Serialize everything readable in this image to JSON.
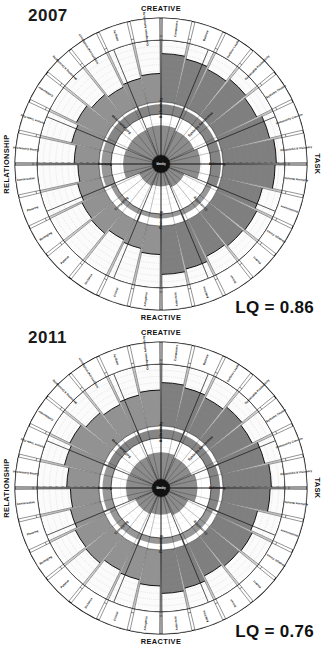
{
  "meta": {
    "colors": {
      "fill_dark": "#787878",
      "fill_mid": "#8c8c8c",
      "stroke": "#111111",
      "grid": "#9a9a9a",
      "background": "#ffffff",
      "hub": "#111111"
    }
  },
  "panels": [
    {
      "year": "2007",
      "lq": "LQ = 0.86",
      "axes": {
        "top": "CREATIVE",
        "bottom": "REACTIVE",
        "left": "RELATIONSHIP",
        "right": "TASK"
      },
      "hub_label": "Identity",
      "summary_ring": [
        "Authenticity",
        "Systems Awareness",
        "Achieving",
        "Controlling",
        "Protecting",
        "Complying",
        "Relating",
        "Self-Awareness"
      ],
      "outer_dimensions": [
        "Composure",
        "Balance",
        "Selfless Leader",
        "Sustainable Productivity",
        "Systems Thinker",
        "Community Concern",
        "Purposeful & Visionary",
        "Achieves Results",
        "Decisiveness",
        "Strategic Focus",
        "Perfect",
        "Driven",
        "Ambition",
        "Autocratic",
        "Arrogance",
        "Critical",
        "Distance",
        "Passive",
        "Belonging",
        "Pleasing",
        "Conservative",
        "Caring Connection",
        "Fosters Team Play",
        "Collaborator",
        "Mentoring & Developing",
        "Interpersonal Intelligence",
        "Integrity",
        "Courageous Authenticity"
      ],
      "chart_data": {
        "type": "radar",
        "title": "Leadership Circle Profile 2007",
        "scale": {
          "min": 0,
          "max": 100,
          "ticks": [
            10,
            20,
            30,
            40,
            50,
            60,
            70,
            80,
            90,
            99
          ]
        },
        "tick_labels": [
          "10",
          "20",
          "30",
          "40",
          "50",
          "60",
          "70",
          "80",
          "90",
          "99"
        ],
        "creative_values": [
          78,
          74,
          70,
          76,
          72,
          80,
          86,
          84,
          68,
          72,
          70,
          66,
          74,
          78
        ],
        "reactive_values": [
          46,
          40,
          36,
          44,
          42,
          38,
          34,
          40,
          48,
          52,
          44,
          38,
          42,
          46
        ],
        "summary_values": {
          "Authenticity": 80,
          "Systems Awareness": 74,
          "Achieving": 82,
          "Controlling": 44,
          "Protecting": 36,
          "Complying": 40,
          "Relating": 78,
          "Self-Awareness": 76
        },
        "lq_score": 0.86
      }
    },
    {
      "year": "2011",
      "lq": "LQ = 0.76",
      "axes": {
        "top": "CREATIVE",
        "bottom": "REACTIVE",
        "left": "RELATIONSHIP",
        "right": "TASK"
      },
      "hub_label": "Identity",
      "summary_ring": [
        "Authenticity",
        "Systems Awareness",
        "Achieving",
        "Controlling",
        "Protecting",
        "Complying",
        "Relating",
        "Self-Awareness"
      ],
      "outer_dimensions": [
        "Composure",
        "Balance",
        "Selfless Leader",
        "Sustainable Productivity",
        "Systems Thinker",
        "Community Concern",
        "Purposeful & Visionary",
        "Achieves Results",
        "Decisiveness",
        "Strategic Focus",
        "Perfect",
        "Driven",
        "Ambition",
        "Autocratic",
        "Arrogance",
        "Critical",
        "Distance",
        "Passive",
        "Belonging",
        "Pleasing",
        "Conservative",
        "Caring Connection",
        "Fosters Team Play",
        "Collaborator",
        "Mentoring & Developing",
        "Interpersonal Intelligence",
        "Integrity",
        "Courageous Authenticity"
      ],
      "chart_data": {
        "type": "radar",
        "title": "Leadership Circle Profile 2011",
        "scale": {
          "min": 0,
          "max": 100,
          "ticks": [
            10,
            20,
            30,
            40,
            50,
            60,
            70,
            80,
            90,
            99
          ]
        },
        "tick_labels": [
          "10",
          "20",
          "30",
          "40",
          "50",
          "60",
          "70",
          "80",
          "90",
          "99"
        ],
        "creative_values": [
          70,
          66,
          62,
          68,
          64,
          72,
          78,
          76,
          60,
          64,
          62,
          58,
          66,
          70
        ],
        "reactive_values": [
          58,
          52,
          48,
          56,
          54,
          50,
          46,
          52,
          60,
          64,
          56,
          50,
          54,
          58
        ],
        "summary_values": {
          "Authenticity": 72,
          "Systems Awareness": 66,
          "Achieving": 74,
          "Controlling": 56,
          "Protecting": 48,
          "Complying": 52,
          "Relating": 70,
          "Self-Awareness": 68
        },
        "lq_score": 0.76
      }
    }
  ]
}
